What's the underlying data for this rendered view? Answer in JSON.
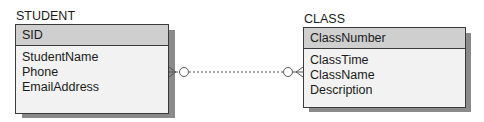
{
  "entities": {
    "student": {
      "name": "STUDENT",
      "primary_key": "SID",
      "attributes": [
        "StudentName",
        "Phone",
        "EmailAddress"
      ]
    },
    "class": {
      "name": "CLASS",
      "primary_key": "ClassNumber",
      "attributes": [
        "ClassTime",
        "ClassName",
        "Description"
      ]
    }
  },
  "relationship": {
    "from": "STUDENT",
    "to": "CLASS",
    "line_style": "dashed",
    "from_cardinality": "zero-or-many",
    "to_cardinality": "zero-or-many"
  },
  "colors": {
    "header_fill": "#cfcfcf",
    "body_fill": "#f2f2f2",
    "border": "#3a3a3a",
    "shadow": "#8a8a8a"
  }
}
